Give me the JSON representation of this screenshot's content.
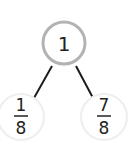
{
  "diagram": {
    "type": "number-bond",
    "whole": {
      "label": "1"
    },
    "parts": [
      {
        "numerator": "1",
        "denominator": "8"
      },
      {
        "numerator": "7",
        "denominator": "8"
      }
    ],
    "colors": {
      "whole_stroke": "#b3b3b3",
      "part_stroke": "#eeeeee",
      "line": "#1a1a1a",
      "text": "#222222"
    }
  }
}
